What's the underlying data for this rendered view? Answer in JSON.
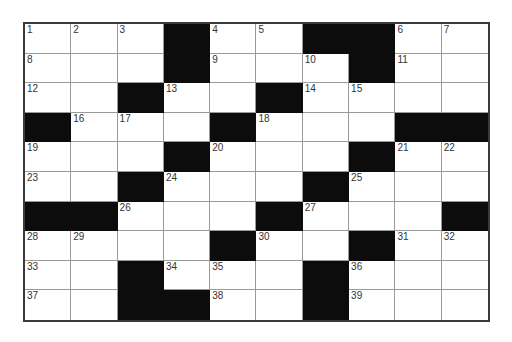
{
  "puzzle": {
    "rows": 10,
    "cols": 10,
    "colors": {
      "block": "#0c0c0c",
      "cell": "#ffffff",
      "grid_line": "#9a9a9a",
      "border": "#3a3a3a",
      "number": "#333333"
    },
    "grid": [
      [
        1,
        2,
        3,
        "#",
        4,
        5,
        "#",
        "#",
        6,
        7
      ],
      [
        8,
        "",
        "",
        "#",
        9,
        "",
        10,
        "#",
        11,
        ""
      ],
      [
        12,
        "",
        "#",
        13,
        "",
        "#",
        14,
        15,
        "",
        ""
      ],
      [
        "#",
        16,
        17,
        "",
        "#",
        18,
        "",
        "",
        "#",
        "#"
      ],
      [
        19,
        "",
        "",
        "#",
        20,
        "",
        "",
        "#",
        21,
        22
      ],
      [
        23,
        "",
        "#",
        24,
        "",
        "",
        "#",
        25,
        "",
        ""
      ],
      [
        "#",
        "#",
        26,
        "",
        "",
        "#",
        27,
        "",
        "",
        "#"
      ],
      [
        28,
        29,
        "",
        "",
        "#",
        30,
        "",
        "#",
        31,
        32
      ],
      [
        33,
        "",
        "#",
        34,
        35,
        "",
        "#",
        36,
        "",
        ""
      ],
      [
        37,
        "",
        "#",
        "#",
        38,
        "",
        "#",
        39,
        "",
        ""
      ]
    ]
  }
}
